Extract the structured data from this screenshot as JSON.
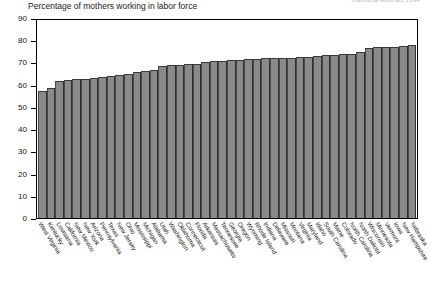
{
  "corner_note": "Statistical Abstract 1994",
  "chart_data": {
    "type": "bar",
    "title": "Percentage of mothers working in labor force",
    "xlabel": "",
    "ylabel": "",
    "ylim": [
      0,
      90
    ],
    "yticks": [
      0,
      10,
      20,
      30,
      40,
      50,
      60,
      70,
      80,
      90
    ],
    "grid": false,
    "legend": "none",
    "bar_color": "#8a8a8a",
    "categories": [
      "West Virginia",
      "Kentucky",
      "Louisiana",
      "California",
      "New Mexico",
      "New York",
      "Arizona",
      "Pennsylvania",
      "Texas",
      "New Jersey",
      "Ohio",
      "Mississippi",
      "Michigan",
      "Alabama",
      "Utah",
      "Washington",
      "Oklahoma",
      "Connecticut",
      "Florida",
      "Arkansas",
      "Massachusetts",
      "Tennessee",
      "Georgia",
      "Oregon",
      "Wyoming",
      "Rhode Island",
      "Indiana",
      "Delaware",
      "Missouri",
      "Montana",
      "Virginia",
      "Maryland",
      "Idaho",
      "South Carolina",
      "Maine",
      "Colorado",
      "North Carolina",
      "North Dakota",
      "Wisconsin",
      "Minnesota",
      "Vermont",
      "Iowa",
      "New Hampshire",
      "Nebraska"
    ],
    "values": [
      57.0,
      58.5,
      61.5,
      62.0,
      62.5,
      62.5,
      63.0,
      63.5,
      64.0,
      64.5,
      65.0,
      65.5,
      66.0,
      66.5,
      68.5,
      69.0,
      69.0,
      69.5,
      69.5,
      70.0,
      70.5,
      70.5,
      71.0,
      71.0,
      71.5,
      71.5,
      72.0,
      72.0,
      72.0,
      72.0,
      72.5,
      72.5,
      73.0,
      73.5,
      73.5,
      74.0,
      74.0,
      74.5,
      76.5,
      77.0,
      77.0,
      77.0,
      77.5,
      78.0
    ]
  }
}
